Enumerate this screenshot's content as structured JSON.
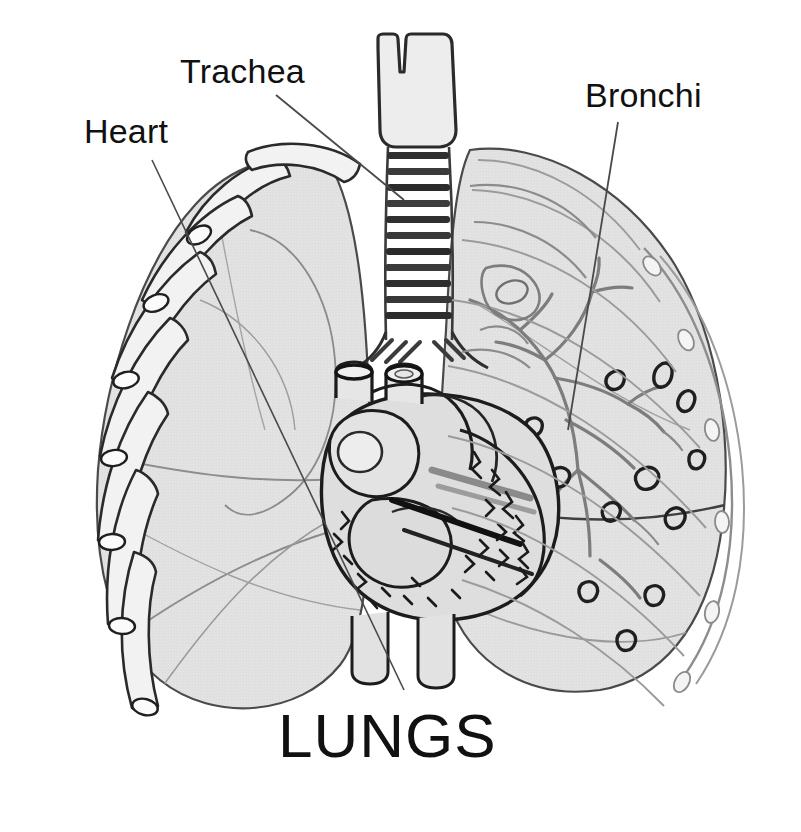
{
  "figure": {
    "kind": "anatomical-illustration",
    "title": "LUNGS",
    "background_color": "#ffffff",
    "ink_color": "#111111",
    "lung_fill_color": "#e2e2e2",
    "lung_fill_light": "#ececec",
    "cartilage_fill_color": "#d8d8d8",
    "faint_line_color": "#9a9a9a"
  },
  "labels": [
    {
      "id": "trachea",
      "text": "Trachea",
      "points_to": "windpipe-cartilage-rings"
    },
    {
      "id": "heart",
      "text": "Heart",
      "points_to": "heart-cross-section"
    },
    {
      "id": "bronchi",
      "text": "Bronchi",
      "points_to": "bronchial-tree-right-lung"
    }
  ],
  "parts": [
    {
      "id": "trachea",
      "name": "Trachea"
    },
    {
      "id": "larynx",
      "name": "Thyroid cartilage"
    },
    {
      "id": "left-lung",
      "name": "Left lung"
    },
    {
      "id": "right-lung",
      "name": "Right lung"
    },
    {
      "id": "heart",
      "name": "Heart"
    },
    {
      "id": "aorta",
      "name": "Aorta"
    },
    {
      "id": "pulmonary-artery",
      "name": "Pulmonary artery"
    },
    {
      "id": "bronchial-tree",
      "name": "Bronchial tree"
    },
    {
      "id": "ribs",
      "name": "Ribs"
    },
    {
      "id": "vessels",
      "name": "Vessel cross-sections"
    },
    {
      "id": "fissures",
      "name": "Lobar fissures"
    }
  ]
}
